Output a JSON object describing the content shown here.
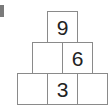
{
  "pyramid": {
    "rows": [
      {
        "cells": [
          "9"
        ]
      },
      {
        "cells": [
          "",
          "6"
        ]
      },
      {
        "cells": [
          "",
          "3",
          ""
        ]
      }
    ]
  }
}
